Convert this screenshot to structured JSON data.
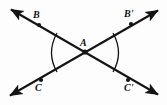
{
  "figure": {
    "background_color": "#fdfdfd",
    "stroke_color": "#141414",
    "label_color": "#111111"
  },
  "vertex": {
    "name": "A",
    "label": "A",
    "x": 85,
    "y": 52,
    "label_x": 80,
    "label_y": 38
  },
  "points": [
    {
      "id": "B",
      "label": "B",
      "dot_x": 39,
      "dot_y": 25,
      "label_x": 33,
      "label_y": 10,
      "position": "top-left"
    },
    {
      "id": "Bprime",
      "label": "B'",
      "dot_x": 131,
      "dot_y": 24,
      "label_x": 124,
      "label_y": 9,
      "position": "top-right"
    },
    {
      "id": "C",
      "label": "C",
      "dot_x": 41,
      "dot_y": 80,
      "label_x": 35,
      "label_y": 83,
      "position": "bottom-left"
    },
    {
      "id": "Cprime",
      "label": "C'",
      "dot_x": 128,
      "dot_y": 80,
      "label_x": 124,
      "label_y": 83,
      "position": "bottom-right"
    }
  ],
  "lines": [
    {
      "id": "line-B-Cprime",
      "from": {
        "x": 9,
        "y": 8
      },
      "to": {
        "x": 160,
        "y": 96
      },
      "arrow_start": true,
      "arrow_end": true
    },
    {
      "id": "line-C-Bprime",
      "from": {
        "x": 8,
        "y": 97
      },
      "to": {
        "x": 160,
        "y": 9
      },
      "arrow_start": true,
      "arrow_end": true
    }
  ],
  "angle_arcs": [
    {
      "id": "left-angle-arc",
      "side": "left",
      "start": {
        "x": 57,
        "y": 33
      },
      "control": {
        "x": 47,
        "y": 53
      },
      "end": {
        "x": 57,
        "y": 72
      }
    },
    {
      "id": "right-angle-arc",
      "side": "right",
      "start": {
        "x": 113,
        "y": 33
      },
      "control": {
        "x": 123,
        "y": 53
      },
      "end": {
        "x": 113,
        "y": 72
      }
    }
  ]
}
